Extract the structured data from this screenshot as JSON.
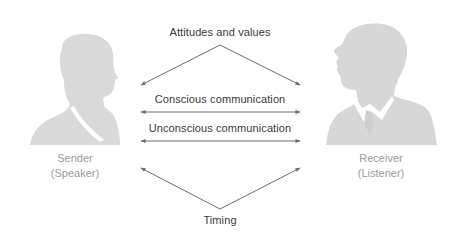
{
  "diagram": {
    "top_label": "Attitudes and values",
    "conscious_label": "Conscious communication",
    "unconscious_label": "Unconscious communication",
    "bottom_label": "Timing"
  },
  "sender": {
    "name": "Sender",
    "role": "(Speaker)",
    "icon": "female-silhouette-icon"
  },
  "receiver": {
    "name": "Receiver",
    "role": "(Listener)",
    "icon": "male-silhouette-icon"
  },
  "colors": {
    "silhouette": "#d9d9d9",
    "arrow": "#6b6b6b",
    "center_text": "#3a3a3a",
    "person_text": "#9a9a9a",
    "background": "#ffffff"
  }
}
